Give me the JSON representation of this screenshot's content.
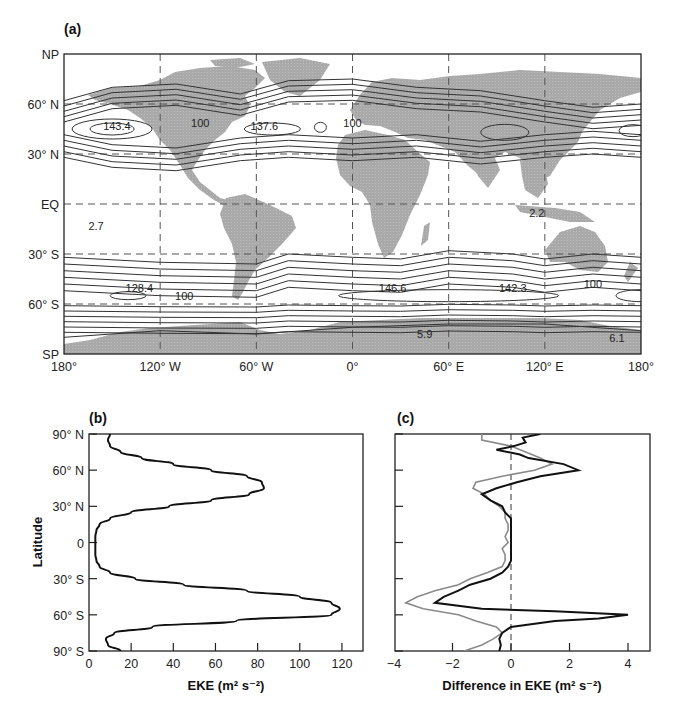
{
  "figure": {
    "panel_a": {
      "label": "(a)",
      "y_ticks": [
        "NP",
        "60° N",
        "30° N",
        "EQ",
        "30° S",
        "60° S",
        "SP"
      ],
      "x_ticks": [
        "180°",
        "120° W",
        "60° W",
        "0°",
        "60° E",
        "120° E",
        "180°"
      ],
      "contour_labels": [
        {
          "text": "143.4",
          "lon": -147,
          "lat": 45
        },
        {
          "text": "100",
          "lon": -95,
          "lat": 47
        },
        {
          "text": "137.6",
          "lon": -55,
          "lat": 45
        },
        {
          "text": "100",
          "lon": 0,
          "lat": 47
        },
        {
          "text": "2.7",
          "lon": -160,
          "lat": -15
        },
        {
          "text": "2.2",
          "lon": 115,
          "lat": -7
        },
        {
          "text": "128.4",
          "lon": -133,
          "lat": -52
        },
        {
          "text": "100",
          "lon": -105,
          "lat": -57
        },
        {
          "text": "146.6",
          "lon": 25,
          "lat": -52
        },
        {
          "text": "142.3",
          "lon": 100,
          "lat": -52
        },
        {
          "text": "100",
          "lon": 150,
          "lat": -50
        },
        {
          "text": "5.9",
          "lon": 45,
          "lat": -80
        },
        {
          "text": "6.1",
          "lon": 165,
          "lat": -82
        }
      ]
    },
    "panel_b": {
      "label": "(b)",
      "ylabel": "Latitude",
      "xlabel": "EKE (m² s⁻²)",
      "y_ticks": [
        "90° N",
        "60° N",
        "30° N",
        "0",
        "30° S",
        "60° S",
        "90° S"
      ],
      "x_ticks": [
        "0",
        "20",
        "40",
        "60",
        "80",
        "100",
        "120"
      ]
    },
    "panel_c": {
      "label": "(c)",
      "xlabel": "Difference in EKE (m² s⁻²)",
      "x_ticks": [
        "−4",
        "−2",
        "0",
        "2",
        "4"
      ]
    }
  },
  "chart_data": [
    {
      "type": "heatmap",
      "title": "(a) Global map of eddy kinetic energy contours",
      "xlabel": "Longitude",
      "ylabel": "Latitude",
      "x_ticks": [
        "180°",
        "120° W",
        "60° W",
        "0°",
        "60° E",
        "120° E",
        "180°"
      ],
      "y_ticks": [
        "NP",
        "60° N",
        "30° N",
        "EQ",
        "30° S",
        "60° S",
        "SP"
      ],
      "xlim": [
        -180,
        180
      ],
      "ylim": [
        -90,
        90
      ],
      "grid": "dashed every 60° lon and 30° lat",
      "annotations": [
        {
          "value": 143.4,
          "lon": -147,
          "lat": 45,
          "note": "N Pacific storm track max"
        },
        {
          "value": 100,
          "lon": -95,
          "lat": 47
        },
        {
          "value": 137.6,
          "lon": -55,
          "lat": 45,
          "note": "N Atlantic storm track max"
        },
        {
          "value": 100,
          "lon": 0,
          "lat": 47
        },
        {
          "value": 2.7,
          "lon": -160,
          "lat": -15,
          "note": "tropical minimum"
        },
        {
          "value": 2.2,
          "lon": 115,
          "lat": -7,
          "note": "tropical minimum"
        },
        {
          "value": 128.4,
          "lon": -133,
          "lat": -52
        },
        {
          "value": 100,
          "lon": -105,
          "lat": -57
        },
        {
          "value": 146.6,
          "lon": 25,
          "lat": -52,
          "note": "Southern Ocean max"
        },
        {
          "value": 142.3,
          "lon": 100,
          "lat": -52
        },
        {
          "value": 100,
          "lon": 150,
          "lat": -50
        },
        {
          "value": 5.9,
          "lon": 45,
          "lat": -80,
          "note": "Antarctic minimum"
        },
        {
          "value": 6.1,
          "lon": 165,
          "lat": -82
        }
      ]
    },
    {
      "type": "line",
      "title": "(b)",
      "xlabel": "EKE (m² s⁻²)",
      "ylabel": "Latitude",
      "xlim": [
        0,
        130
      ],
      "ylim": [
        -90,
        90
      ],
      "x_ticks": [
        0,
        20,
        40,
        60,
        80,
        100,
        120
      ],
      "y_ticks": [
        "90° N",
        "60° N",
        "30° N",
        "0",
        "30° S",
        "60° S",
        "90° S"
      ],
      "series": [
        {
          "name": "Zonal-mean EKE",
          "color": "#111111",
          "lat": [
            90,
            85,
            80,
            75,
            70,
            65,
            60,
            55,
            50,
            45,
            40,
            35,
            30,
            25,
            20,
            15,
            10,
            5,
            0,
            -5,
            -10,
            -15,
            -20,
            -25,
            -30,
            -35,
            -40,
            -45,
            -50,
            -55,
            -60,
            -65,
            -70,
            -75,
            -80,
            -85,
            -90
          ],
          "values": [
            10,
            9,
            10,
            15,
            25,
            40,
            58,
            75,
            82,
            83,
            76,
            58,
            38,
            20,
            10,
            5,
            3.5,
            3,
            3,
            3,
            3,
            3.5,
            5,
            10,
            22,
            45,
            75,
            100,
            115,
            119,
            115,
            70,
            30,
            12,
            8,
            9,
            15
          ]
        }
      ]
    },
    {
      "type": "line",
      "title": "(c)",
      "xlabel": "Difference in EKE (m² s⁻²)",
      "ylabel": "Latitude",
      "xlim": [
        -4,
        4.7
      ],
      "ylim": [
        -90,
        90
      ],
      "x_ticks": [
        -4,
        -2,
        0,
        2,
        4
      ],
      "reference_line": {
        "x": 0,
        "style": "dashed"
      },
      "series": [
        {
          "name": "Difference (black)",
          "color": "#111111",
          "lat": [
            90,
            87,
            83,
            80,
            77,
            73,
            70,
            65,
            60,
            55,
            50,
            45,
            40,
            35,
            30,
            25,
            20,
            15,
            10,
            5,
            0,
            -5,
            -10,
            -15,
            -20,
            -25,
            -30,
            -35,
            -40,
            -45,
            -50,
            -55,
            -57,
            -60,
            -63,
            -65,
            -70,
            -75,
            -80,
            -85,
            -90
          ],
          "values": [
            1.0,
            0.4,
            0.5,
            0.1,
            -0.5,
            0.3,
            0.6,
            1.8,
            2.3,
            1.0,
            0.2,
            -0.5,
            -1.0,
            -0.7,
            -0.3,
            -0.2,
            0,
            0,
            0,
            0,
            0,
            0,
            0,
            0,
            -0.1,
            -0.3,
            -0.7,
            -1.4,
            -1.8,
            -2.3,
            -2.6,
            -1.0,
            1.5,
            4.0,
            3.0,
            1.5,
            0.0,
            -0.3,
            -0.4,
            -0.35,
            -0.4
          ]
        },
        {
          "name": "Difference (grey)",
          "color": "#8a8a8a",
          "lat": [
            90,
            85,
            80,
            75,
            70,
            65,
            60,
            55,
            50,
            45,
            40,
            35,
            30,
            25,
            20,
            15,
            10,
            5,
            0,
            -5,
            -10,
            -15,
            -20,
            -25,
            -30,
            -35,
            -40,
            -45,
            -50,
            -55,
            -60,
            -65,
            -70,
            -75,
            -80,
            -85,
            -90
          ],
          "values": [
            -1.0,
            -1.0,
            0.0,
            0.5,
            1.0,
            1.4,
            0.8,
            -0.3,
            -1.2,
            -1.3,
            -0.9,
            -0.7,
            -0.4,
            -0.2,
            -0.2,
            -0.1,
            -0.1,
            -0.2,
            -0.1,
            -0.3,
            -0.2,
            -0.2,
            -0.3,
            -0.8,
            -1.4,
            -1.8,
            -2.6,
            -3.2,
            -3.6,
            -3.0,
            -1.8,
            -1.2,
            -0.5,
            -0.3,
            -0.6,
            -1.0,
            -1.6
          ]
        }
      ]
    }
  ]
}
